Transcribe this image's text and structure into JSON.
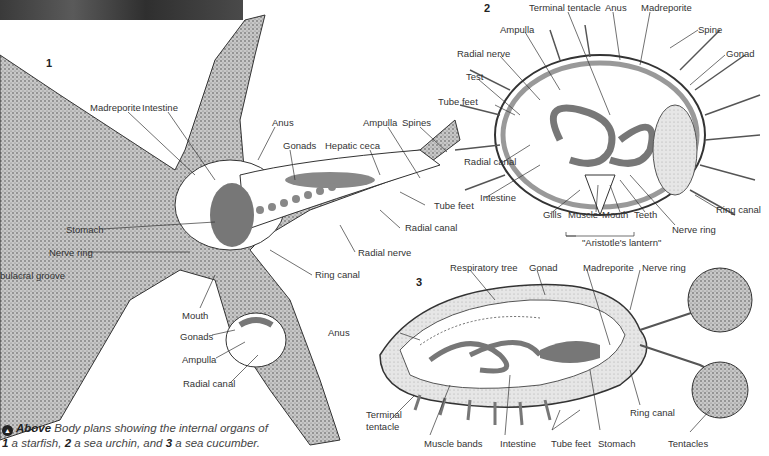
{
  "figure": {
    "panels": [
      {
        "number": "1",
        "subject": "starfish",
        "labels": [
          "Madreporite",
          "Intestine",
          "Anus",
          "Gonads",
          "Hepatic ceca",
          "Ampulla",
          "Spines",
          "Tube feet",
          "Radial canal",
          "Radial nerve",
          "Ring canal",
          "Stomach",
          "Nerve ring",
          "bulacral groove",
          "Mouth",
          "Gonads",
          "Ampulla",
          "Radial canal"
        ]
      },
      {
        "number": "2",
        "subject": "sea urchin",
        "labels": [
          "Terminal tentacle",
          "Anus",
          "Madreporite",
          "Spine",
          "Gonad",
          "Ampulla",
          "Radial nerve",
          "Test",
          "Tube feet",
          "Radial canal",
          "Intestine",
          "Gills",
          "Muscle",
          "Mouth",
          "Teeth",
          "Nerve ring",
          "Ring canal",
          "\"Aristotle's lantern\""
        ]
      },
      {
        "number": "3",
        "subject": "sea cucumber",
        "labels": [
          "Respiratory tree",
          "Gonad",
          "Madreporite",
          "Nerve ring",
          "Anus",
          "Terminal tentacle",
          "Muscle bands",
          "Intestine",
          "Tube feet",
          "Stomach",
          "Ring canal",
          "Tentacles"
        ]
      }
    ]
  },
  "p1": {
    "num": "1",
    "madreporite": "Madreporite",
    "intestine": "Intestine",
    "anus": "Anus",
    "gonads": "Gonads",
    "hepatic": "Hepatic ceca",
    "ampulla": "Ampulla",
    "spines": "Spines",
    "tubefeet": "Tube feet",
    "radialcanal": "Radial canal",
    "radialnerve": "Radial nerve",
    "ringcanal": "Ring canal",
    "stomach": "Stomach",
    "nervering": "Nerve ring",
    "groove": "bulacral groove",
    "mouth": "Mouth",
    "gonads2": "Gonads",
    "ampulla2": "Ampulla",
    "radialcanal2": "Radial canal"
  },
  "p2": {
    "num": "2",
    "terminal": "Terminal tentacle",
    "anus": "Anus",
    "madreporite": "Madreporite",
    "spine": "Spine",
    "gonad": "Gonad",
    "ampulla": "Ampulla",
    "radialnerve": "Radial nerve",
    "test": "Test",
    "tubefeet": "Tube feet",
    "radialcanal": "Radial canal",
    "intestine": "Intestine",
    "gills": "Gills",
    "muscle": "Muscle",
    "mouth": "Mouth",
    "teeth": "Teeth",
    "nervering": "Nerve ring",
    "ringcanal": "Ring canal",
    "lantern": "\"Aristotle's lantern\""
  },
  "p3": {
    "num": "3",
    "resp": "Respiratory tree",
    "gonad": "Gonad",
    "madreporite": "Madreporite",
    "nervering": "Nerve ring",
    "anus": "Anus",
    "terminal1": "Terminal",
    "terminal2": "tentacle",
    "muscle": "Muscle bands",
    "intestine": "Intestine",
    "tubefeet": "Tube feet",
    "stomach": "Stomach",
    "ringcanal": "Ring canal",
    "tentacles": "Tentacles"
  },
  "caption": {
    "icon": "up-arrow-icon",
    "lead": "Above",
    "line1": " Body plans showing the internal organs of",
    "n1": "1",
    "t1": " a starfish, ",
    "n2": "2",
    "t2": " a sea urchin, and ",
    "n3": "3",
    "t3": " a sea cucumber."
  },
  "colors": {
    "organ": "#7a7a7a",
    "stipple": "#9a9a9a",
    "line": "#333333"
  }
}
